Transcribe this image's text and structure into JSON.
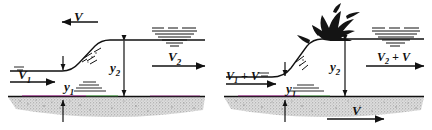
{
  "figure": {
    "type": "technical-diagram",
    "panels": [
      {
        "id": "left",
        "name": "stationary-hydraulic-jump",
        "labels": {
          "upstream_velocity": "V",
          "upstream_velocity_sub": "1",
          "downstream_velocity": "V",
          "downstream_velocity_sub": "2",
          "upstream_depth": "y",
          "upstream_depth_sub": "1",
          "downstream_depth": "y",
          "downstream_depth_sub": "2",
          "surge_velocity": "V"
        },
        "arrows": {
          "top_surge_direction": "left",
          "upstream_flow_direction": "right",
          "downstream_flow_direction": "right"
        }
      },
      {
        "id": "right",
        "name": "moving-frame-surge",
        "labels": {
          "upstream_velocity": "V",
          "upstream_velocity_sub": "1",
          "upstream_velocity_add": "+ V",
          "downstream_velocity": "V",
          "downstream_velocity_sub": "2",
          "downstream_velocity_add": "+ V",
          "upstream_depth": "y",
          "upstream_depth_sub": "1",
          "downstream_depth": "y",
          "downstream_depth_sub": "2",
          "bed_velocity": "V"
        },
        "arrows": {
          "upstream_flow_direction": "right",
          "downstream_flow_direction": "right",
          "bed_direction": "right"
        }
      }
    ],
    "colors": {
      "ink": "#111111",
      "bed_fill": "#d9d9d9",
      "bed_stipple": "#9a9a9a",
      "water_line": "#1a1a1a",
      "accent_magenta": "#a0308f",
      "accent_green": "#4aa34a",
      "splash": "#1a1a1a",
      "background": "#ffffff"
    }
  }
}
